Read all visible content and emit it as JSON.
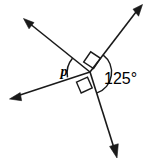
{
  "figure": {
    "kind": "geometry-angle-diagram",
    "background_color": "#ffffff",
    "stroke_color": "#1a1a1a",
    "width": 147,
    "height": 163,
    "vertex": {
      "x": 90,
      "y": 72
    },
    "labels": {
      "angle_variable": "p",
      "angle_measure": "125°"
    },
    "label_positions": {
      "angle_variable": {
        "x": 64,
        "y": 76
      },
      "angle_measure": {
        "x": 104,
        "y": 84
      }
    },
    "rays": [
      {
        "name": "ray-upper-left",
        "tip": {
          "x": 24,
          "y": 19
        },
        "has_arrow": true
      },
      {
        "name": "ray-upper-right",
        "tip": {
          "x": 142,
          "y": 6
        },
        "has_arrow": true
      },
      {
        "name": "ray-lower-left",
        "tip": {
          "x": 10,
          "y": 99
        },
        "has_arrow": true
      },
      {
        "name": "ray-lower-right",
        "tip": {
          "x": 117,
          "y": 157
        },
        "has_arrow": true
      }
    ],
    "right_angle_marks": [
      {
        "name": "right-angle-mark-upper",
        "x": 91,
        "y": 57
      },
      {
        "name": "right-angle-mark-lower",
        "x": 83,
        "y": 85
      }
    ],
    "arcs": [
      {
        "name": "arc-angle-p",
        "label": "p"
      },
      {
        "name": "arc-angle-125",
        "label": "125°"
      }
    ]
  }
}
